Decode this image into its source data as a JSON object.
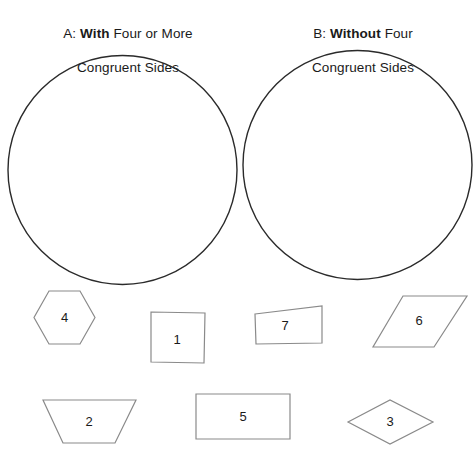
{
  "worksheet": {
    "title": "Sorting quadrilaterals and polygons by congruent sides",
    "headings": [
      {
        "id": "A",
        "prefix": "A:",
        "emphasis": "With",
        "rest": "Four or More",
        "line2": "Congruent Sides",
        "full_text": "A: With Four or More Congruent Sides"
      },
      {
        "id": "B",
        "prefix": "B:",
        "emphasis": "Without",
        "rest": "Four",
        "line2": "Congruent Sides",
        "full_text": "B: Without Four Congruent Sides"
      }
    ],
    "sorting_circles": [
      {
        "name": "circle-a",
        "label": "A",
        "cx": 122.5,
        "cy": 170,
        "r": 114.5
      },
      {
        "name": "circle-b",
        "label": "B",
        "cx": 357.5,
        "cy": 165,
        "r": 114.5
      }
    ],
    "shapes": [
      {
        "number": "4",
        "shape_type": "hexagon",
        "points": "49,291 80,291 95,317.5 80,344 49,344 34,317.5",
        "label_x": 64.5,
        "label_y": 318
      },
      {
        "number": "1",
        "shape_type": "square",
        "points": "151,312 205,313 204,363 151,362",
        "label_x": 177,
        "label_y": 340
      },
      {
        "number": "7",
        "shape_type": "irregular-quadrilateral",
        "points": "255,314 322,306 322,343 256,344",
        "label_x": 285,
        "label_y": 326
      },
      {
        "number": "6",
        "shape_type": "parallelogram",
        "points": "403,296 467,296 434,347 373,347",
        "label_x": 419,
        "label_y": 321
      },
      {
        "number": "2",
        "shape_type": "trapezoid",
        "points": "43,400 136,400 115,443 63,443",
        "label_x": 89,
        "label_y": 422
      },
      {
        "number": "5",
        "shape_type": "rectangle",
        "points": "196,394 290,394 290,439 196,439",
        "label_x": 243,
        "label_y": 417
      },
      {
        "number": "3",
        "shape_type": "rhombus",
        "points": "348,422 390,400 433,422 390,444",
        "label_x": 390,
        "label_y": 422
      }
    ],
    "colors": {
      "background": "#ffffff",
      "circle_stroke": "#2a2a2a",
      "shape_stroke": "#8a8a8a",
      "text": "#1a1a1a"
    }
  }
}
